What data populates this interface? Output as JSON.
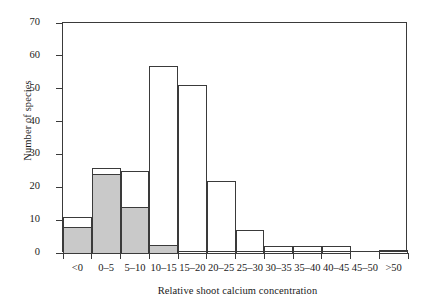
{
  "chart_data": {
    "type": "bar",
    "title": "",
    "xlabel": "Relative shoot calcium concentration",
    "ylabel": "Number of species",
    "categories": [
      "<0",
      "0–5",
      "5–10",
      "10–15",
      "15–20",
      "20–25",
      "25–30",
      "30–35",
      "35–40",
      "40–45",
      "45–50",
      ">50"
    ],
    "series": [
      {
        "name": "Total number of species",
        "values": [
          11,
          26,
          25,
          57,
          51,
          22,
          7,
          2,
          2,
          2,
          0,
          1
        ]
      },
      {
        "name": "Shaded subset",
        "values": [
          8,
          24,
          14,
          2.5,
          0,
          0,
          0,
          0,
          0,
          0,
          0,
          0
        ]
      }
    ],
    "ylim": [
      0,
      70
    ],
    "yticks": [
      0,
      10,
      20,
      30,
      40,
      50,
      60,
      70
    ],
    "ytick_labels": [
      "0",
      "10",
      "20",
      "30",
      "40",
      "50",
      "60",
      "70"
    ],
    "grid": false,
    "legend": "none",
    "colors": {
      "shaded_fill": "#c9c9c9",
      "outline": "#3a3a3a",
      "background": "#ffffff"
    }
  }
}
